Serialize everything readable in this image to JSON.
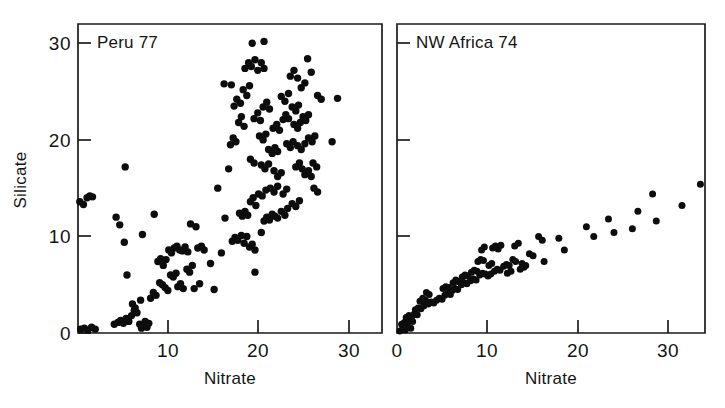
{
  "figure": {
    "background": "#ffffff",
    "ink_color": "#0d0d0d",
    "panel_count": 2
  },
  "chart_data": [
    {
      "type": "scatter",
      "title": "Peru 77",
      "xlabel": "Nitrate",
      "ylabel": "Silicate",
      "xlim": [
        0,
        33.5
      ],
      "ylim": [
        0,
        32
      ],
      "xticks": [
        10,
        20,
        30
      ],
      "xticklabels": [
        "10",
        "20",
        "30"
      ],
      "yticks": [
        0,
        10,
        20,
        30
      ],
      "yticklabels": [
        "0",
        "10",
        "20",
        "30"
      ],
      "grid": false,
      "legend": "none",
      "marker": "filled-circle",
      "points": [
        [
          0.2,
          13.6
        ],
        [
          0.6,
          13.3
        ],
        [
          1.0,
          14.0
        ],
        [
          1.3,
          14.2
        ],
        [
          1.6,
          14.1
        ],
        [
          0.3,
          0.4
        ],
        [
          0.7,
          0.5
        ],
        [
          1.1,
          0.3
        ],
        [
          1.5,
          0.6
        ],
        [
          1.9,
          0.4
        ],
        [
          4.0,
          0.9
        ],
        [
          4.4,
          1.1
        ],
        [
          4.7,
          1.3
        ],
        [
          5.0,
          1.0
        ],
        [
          5.3,
          1.5
        ],
        [
          5.6,
          1.2
        ],
        [
          5.9,
          1.8
        ],
        [
          6.2,
          2.3
        ],
        [
          6.5,
          2.1
        ],
        [
          6.8,
          0.9
        ],
        [
          7.0,
          0.5
        ],
        [
          7.2,
          0.8
        ],
        [
          7.4,
          1.2
        ],
        [
          7.6,
          0.6
        ],
        [
          7.8,
          1.0
        ],
        [
          6.0,
          3.0
        ],
        [
          6.3,
          2.6
        ],
        [
          6.9,
          3.4
        ],
        [
          4.2,
          12.0
        ],
        [
          4.6,
          11.2
        ],
        [
          5.1,
          9.4
        ],
        [
          5.4,
          6.0
        ],
        [
          7.1,
          10.2
        ],
        [
          8.4,
          12.3
        ],
        [
          8.0,
          3.6
        ],
        [
          8.3,
          4.2
        ],
        [
          8.6,
          3.9
        ],
        [
          8.8,
          7.4
        ],
        [
          9.1,
          7.7
        ],
        [
          9.4,
          7.0
        ],
        [
          9.7,
          7.6
        ],
        [
          9.0,
          5.2
        ],
        [
          9.3,
          5.0
        ],
        [
          9.6,
          4.7
        ],
        [
          9.9,
          4.4
        ],
        [
          10.0,
          8.6
        ],
        [
          10.3,
          8.3
        ],
        [
          10.6,
          8.8
        ],
        [
          10.9,
          9.0
        ],
        [
          10.2,
          6.0
        ],
        [
          10.5,
          5.8
        ],
        [
          10.8,
          6.2
        ],
        [
          11.2,
          8.6
        ],
        [
          11.5,
          8.5
        ],
        [
          11.8,
          8.9
        ],
        [
          12.1,
          8.4
        ],
        [
          11.0,
          4.8
        ],
        [
          11.3,
          5.1
        ],
        [
          11.6,
          4.6
        ],
        [
          12.0,
          6.6
        ],
        [
          12.3,
          6.3
        ],
        [
          12.6,
          7.0
        ],
        [
          12.4,
          11.3
        ],
        [
          13.0,
          11.0
        ],
        [
          13.2,
          8.8
        ],
        [
          13.6,
          9.0
        ],
        [
          13.9,
          8.6
        ],
        [
          12.8,
          4.6
        ],
        [
          13.4,
          5.1
        ],
        [
          15.0,
          4.5
        ],
        [
          15.4,
          15.0
        ],
        [
          16.2,
          11.9
        ],
        [
          16.6,
          17.0
        ],
        [
          5.2,
          17.2
        ],
        [
          17.0,
          9.5
        ],
        [
          17.3,
          9.9
        ],
        [
          17.6,
          9.6
        ],
        [
          18.0,
          10.1
        ],
        [
          18.3,
          9.3
        ],
        [
          18.6,
          10.0
        ],
        [
          18.9,
          8.9
        ],
        [
          19.2,
          9.2
        ],
        [
          19.5,
          8.6
        ],
        [
          17.8,
          12.4
        ],
        [
          18.1,
          12.1
        ],
        [
          18.4,
          12.6
        ],
        [
          18.7,
          12.2
        ],
        [
          19.0,
          13.6
        ],
        [
          19.3,
          14.0
        ],
        [
          19.6,
          13.2
        ],
        [
          19.9,
          14.4
        ],
        [
          20.2,
          10.4
        ],
        [
          20.5,
          11.6
        ],
        [
          20.8,
          12.0
        ],
        [
          21.1,
          11.7
        ],
        [
          21.4,
          12.3
        ],
        [
          21.7,
          12.1
        ],
        [
          22.0,
          11.9
        ],
        [
          22.4,
          12.6
        ],
        [
          22.8,
          12.2
        ],
        [
          23.1,
          12.9
        ],
        [
          23.6,
          13.4
        ],
        [
          24.0,
          13.1
        ],
        [
          24.4,
          13.7
        ],
        [
          19.5,
          6.3
        ],
        [
          16.8,
          19.5
        ],
        [
          17.1,
          20.2
        ],
        [
          17.4,
          19.8
        ],
        [
          17.7,
          21.8
        ],
        [
          18.0,
          22.4
        ],
        [
          18.3,
          21.4
        ],
        [
          17.2,
          23.5
        ],
        [
          17.5,
          24.2
        ],
        [
          17.9,
          23.8
        ],
        [
          18.2,
          25.2
        ],
        [
          18.6,
          24.6
        ],
        [
          18.9,
          25.6
        ],
        [
          18.4,
          27.4
        ],
        [
          18.8,
          28.0
        ],
        [
          19.1,
          27.6
        ],
        [
          19.5,
          28.3
        ],
        [
          19.8,
          27.2
        ],
        [
          20.2,
          28.0
        ],
        [
          20.5,
          27.4
        ],
        [
          19.2,
          30.0
        ],
        [
          20.5,
          30.2
        ],
        [
          16.1,
          25.8
        ],
        [
          16.9,
          25.7
        ],
        [
          19.4,
          22.2
        ],
        [
          19.8,
          22.8
        ],
        [
          20.1,
          22.0
        ],
        [
          20.4,
          23.4
        ],
        [
          20.8,
          23.9
        ],
        [
          21.1,
          23.2
        ],
        [
          20.0,
          20.4
        ],
        [
          20.4,
          20.0
        ],
        [
          20.7,
          20.6
        ],
        [
          21.0,
          19.0
        ],
        [
          21.4,
          18.6
        ],
        [
          21.7,
          19.2
        ],
        [
          22.0,
          18.8
        ],
        [
          21.5,
          21.2
        ],
        [
          21.9,
          21.6
        ],
        [
          22.2,
          21.0
        ],
        [
          22.6,
          22.1
        ],
        [
          22.9,
          22.6
        ],
        [
          23.2,
          22.2
        ],
        [
          22.4,
          24.5
        ],
        [
          22.8,
          24.0
        ],
        [
          23.2,
          24.8
        ],
        [
          23.6,
          23.4
        ],
        [
          24.0,
          23.0
        ],
        [
          24.3,
          23.6
        ],
        [
          23.8,
          21.6
        ],
        [
          24.2,
          21.2
        ],
        [
          24.5,
          21.8
        ],
        [
          24.8,
          22.4
        ],
        [
          25.1,
          22.0
        ],
        [
          25.4,
          22.6
        ],
        [
          23.4,
          26.6
        ],
        [
          23.8,
          27.2
        ],
        [
          24.2,
          26.4
        ],
        [
          24.6,
          25.4
        ],
        [
          25.0,
          25.9
        ],
        [
          25.3,
          28.4
        ],
        [
          25.7,
          27.0
        ],
        [
          26.4,
          24.6
        ],
        [
          26.8,
          24.2
        ],
        [
          23.0,
          19.6
        ],
        [
          23.4,
          19.2
        ],
        [
          23.7,
          19.8
        ],
        [
          24.2,
          19.4
        ],
        [
          24.6,
          19.0
        ],
        [
          25.0,
          19.6
        ],
        [
          25.4,
          20.2
        ],
        [
          25.8,
          19.8
        ],
        [
          26.1,
          20.4
        ],
        [
          24.0,
          17.2
        ],
        [
          24.4,
          17.6
        ],
        [
          24.7,
          17.0
        ],
        [
          25.0,
          16.4
        ],
        [
          25.4,
          16.8
        ],
        [
          25.7,
          16.2
        ],
        [
          25.9,
          17.6
        ],
        [
          26.3,
          17.2
        ],
        [
          21.6,
          16.8
        ],
        [
          22.0,
          16.2
        ],
        [
          22.4,
          16.6
        ],
        [
          20.2,
          17.4
        ],
        [
          20.6,
          17.0
        ],
        [
          21.0,
          17.5
        ],
        [
          19.0,
          18.0
        ],
        [
          19.4,
          17.6
        ],
        [
          21.2,
          15.0
        ],
        [
          21.6,
          14.6
        ],
        [
          22.0,
          15.2
        ],
        [
          20.3,
          14.2
        ],
        [
          20.7,
          14.8
        ],
        [
          22.6,
          14.4
        ],
        [
          23.0,
          14.9
        ],
        [
          26.0,
          15.0
        ],
        [
          26.4,
          14.6
        ],
        [
          28.6,
          24.3
        ],
        [
          28.0,
          19.8
        ],
        [
          15.8,
          8.3
        ],
        [
          14.6,
          7.2
        ]
      ]
    },
    {
      "type": "scatter",
      "title": "NW Africa 74",
      "xlabel": "Nitrate",
      "ylabel": "Silicate",
      "xlim": [
        0,
        33.5
      ],
      "ylim": [
        0,
        32
      ],
      "xticks": [
        0,
        10,
        20,
        30
      ],
      "xticklabels": [
        "0",
        "10",
        "20",
        "30"
      ],
      "yticks": [
        0,
        10,
        20,
        30
      ],
      "yticklabels": [
        "",
        "",
        "",
        ""
      ],
      "grid": false,
      "legend": "none",
      "marker": "filled-circle",
      "points": [
        [
          0.3,
          0.2
        ],
        [
          0.6,
          0.4
        ],
        [
          0.9,
          0.3
        ],
        [
          1.2,
          0.6
        ],
        [
          1.5,
          0.5
        ],
        [
          0.5,
          0.9
        ],
        [
          0.8,
          1.1
        ],
        [
          1.1,
          1.0
        ],
        [
          1.4,
          1.3
        ],
        [
          1.7,
          1.2
        ],
        [
          1.0,
          1.6
        ],
        [
          1.3,
          1.8
        ],
        [
          1.6,
          1.7
        ],
        [
          1.9,
          2.0
        ],
        [
          2.2,
          1.9
        ],
        [
          2.0,
          2.4
        ],
        [
          2.3,
          2.6
        ],
        [
          2.6,
          2.5
        ],
        [
          2.9,
          2.8
        ],
        [
          2.5,
          3.3
        ],
        [
          2.8,
          3.6
        ],
        [
          3.1,
          3.4
        ],
        [
          3.4,
          3.0
        ],
        [
          3.7,
          3.2
        ],
        [
          4.0,
          3.1
        ],
        [
          3.2,
          4.2
        ],
        [
          3.5,
          4.0
        ],
        [
          4.3,
          3.4
        ],
        [
          4.6,
          3.6
        ],
        [
          4.9,
          3.5
        ],
        [
          5.2,
          3.9
        ],
        [
          5.5,
          4.1
        ],
        [
          5.8,
          4.0
        ],
        [
          5.0,
          4.6
        ],
        [
          5.3,
          4.8
        ],
        [
          5.6,
          4.7
        ],
        [
          6.0,
          4.4
        ],
        [
          6.3,
          4.6
        ],
        [
          6.6,
          4.5
        ],
        [
          6.1,
          5.2
        ],
        [
          6.4,
          5.5
        ],
        [
          6.7,
          5.3
        ],
        [
          7.0,
          5.0
        ],
        [
          7.3,
          5.2
        ],
        [
          7.6,
          5.1
        ],
        [
          7.1,
          5.8
        ],
        [
          7.4,
          6.0
        ],
        [
          7.7,
          5.9
        ],
        [
          8.0,
          5.4
        ],
        [
          8.3,
          5.6
        ],
        [
          8.6,
          5.5
        ],
        [
          8.1,
          6.3
        ],
        [
          8.4,
          6.5
        ],
        [
          8.7,
          6.4
        ],
        [
          9.0,
          6.0
        ],
        [
          9.3,
          6.2
        ],
        [
          9.6,
          6.1
        ],
        [
          8.8,
          7.4
        ],
        [
          9.1,
          7.6
        ],
        [
          9.4,
          7.5
        ],
        [
          9.9,
          5.9
        ],
        [
          10.2,
          6.1
        ],
        [
          9.2,
          8.6
        ],
        [
          9.5,
          8.9
        ],
        [
          10.0,
          7.0
        ],
        [
          10.3,
          7.2
        ],
        [
          10.6,
          6.4
        ],
        [
          10.9,
          6.6
        ],
        [
          11.2,
          6.5
        ],
        [
          10.4,
          8.8
        ],
        [
          10.7,
          9.0
        ],
        [
          11.0,
          8.7
        ],
        [
          11.3,
          9.1
        ],
        [
          11.6,
          6.9
        ],
        [
          11.9,
          7.1
        ],
        [
          12.2,
          7.0
        ],
        [
          12.0,
          6.2
        ],
        [
          12.4,
          6.4
        ],
        [
          12.6,
          7.6
        ],
        [
          12.9,
          7.4
        ],
        [
          12.8,
          9.0
        ],
        [
          13.2,
          9.3
        ],
        [
          13.6,
          7.2
        ],
        [
          14.0,
          7.0
        ],
        [
          13.4,
          6.6
        ],
        [
          13.8,
          6.8
        ],
        [
          14.4,
          8.2
        ],
        [
          14.8,
          8.0
        ],
        [
          15.4,
          10.0
        ],
        [
          15.8,
          9.6
        ],
        [
          16.0,
          7.4
        ],
        [
          17.6,
          9.8
        ],
        [
          18.2,
          8.6
        ],
        [
          20.6,
          11.0
        ],
        [
          21.4,
          10.0
        ],
        [
          23.0,
          11.8
        ],
        [
          23.6,
          10.4
        ],
        [
          25.6,
          10.8
        ],
        [
          26.2,
          12.6
        ],
        [
          27.8,
          14.4
        ],
        [
          28.2,
          11.6
        ],
        [
          31.0,
          13.2
        ],
        [
          33.0,
          15.4
        ]
      ]
    }
  ]
}
